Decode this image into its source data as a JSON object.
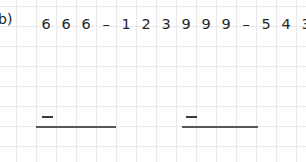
{
  "worksheet": {
    "problem_label": "b)",
    "background_color": "#ffffff",
    "gridline_color": "#e9e9ec",
    "ink_color": "#26262a",
    "rule_color": "#58585c",
    "grid": {
      "cell_width": 20,
      "cell_height": 20,
      "columns": 15,
      "rows": 8
    },
    "problems": [
      {
        "id": "left",
        "expression_text": "666 - 123",
        "tokens": [
          "6",
          "6",
          "6",
          "–",
          "1",
          "2",
          "3"
        ],
        "minuend": "666",
        "operator": "–",
        "subtrahend": "123",
        "answer_value": "",
        "answer_minus_sign": "–"
      },
      {
        "id": "right",
        "expression_text": "999 - 543",
        "tokens": [
          "9",
          "9",
          "9",
          "–",
          "5",
          "4",
          "3"
        ],
        "minuend": "999",
        "operator": "–",
        "subtrahend": "543",
        "answer_value": "",
        "answer_minus_sign": "–"
      }
    ]
  }
}
